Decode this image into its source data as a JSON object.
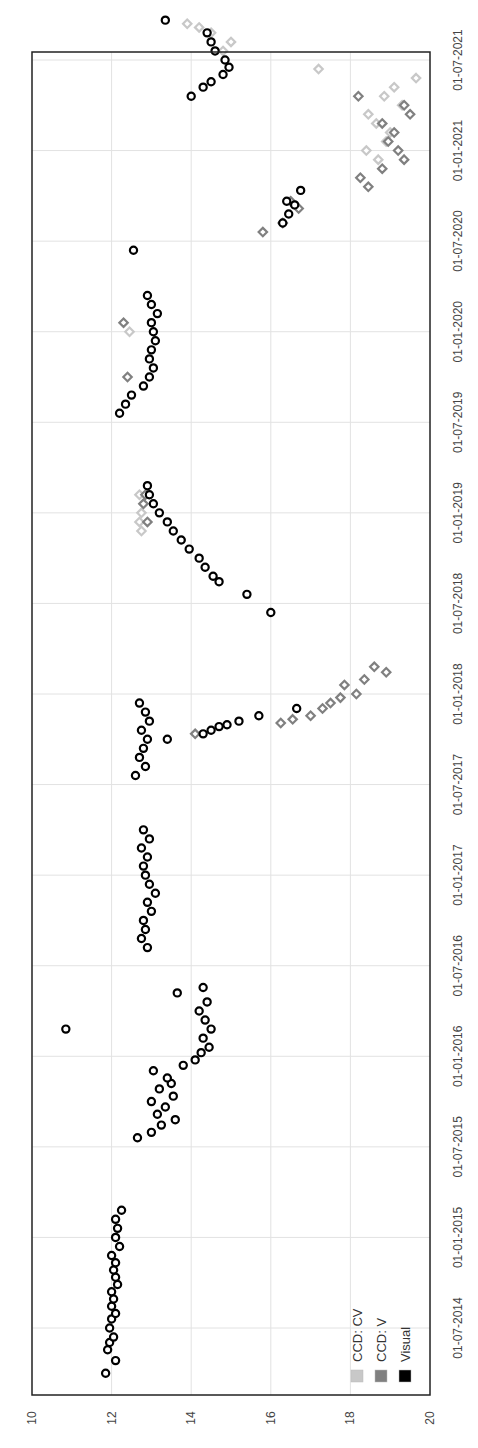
{
  "chart_data": {
    "type": "scatter",
    "title": "",
    "orientation": "rotated-90 (magnitude axis horizontal along bottom/left edge, date axis vertical on right edge)",
    "xlabel": "",
    "ylabel": "",
    "magnitude_axis": {
      "ticks": [
        "10",
        "12",
        "14",
        "16",
        "18",
        "20"
      ],
      "range": [
        10,
        20
      ],
      "inverted": false
    },
    "date_axis": {
      "ticks": [
        "01-07-2014",
        "01-01-2015",
        "01-07-2015",
        "01-01-2016",
        "01-07-2016",
        "01-01-2017",
        "01-07-2017",
        "01-01-2018",
        "01-07-2018",
        "01-01-2019",
        "01-07-2019",
        "01-01-2020",
        "01-07-2020",
        "01-01-2021",
        "01-07-2021"
      ]
    },
    "grid": true,
    "legend": {
      "position": "lower-right (rotated)",
      "entries": [
        {
          "label": "CCD: CV",
          "color": "#c8c8c8"
        },
        {
          "label": "CCD: V",
          "color": "#808080"
        },
        {
          "label": "Visual",
          "color": "#000000"
        }
      ]
    },
    "series": [
      {
        "name": "Visual",
        "marker": "circle",
        "color": "#000000",
        "points": [
          [
            2014.25,
            11.85
          ],
          [
            2014.32,
            12.1
          ],
          [
            2014.38,
            11.9
          ],
          [
            2014.42,
            11.95
          ],
          [
            2014.45,
            12.05
          ],
          [
            2014.5,
            11.95
          ],
          [
            2014.55,
            12.0
          ],
          [
            2014.58,
            12.1
          ],
          [
            2014.62,
            12.0
          ],
          [
            2014.66,
            12.05
          ],
          [
            2014.7,
            12.0
          ],
          [
            2014.74,
            12.15
          ],
          [
            2014.78,
            12.1
          ],
          [
            2014.82,
            12.05
          ],
          [
            2014.86,
            12.1
          ],
          [
            2014.9,
            12.0
          ],
          [
            2014.95,
            12.2
          ],
          [
            2015.0,
            12.1
          ],
          [
            2015.05,
            12.15
          ],
          [
            2015.1,
            12.1
          ],
          [
            2015.15,
            12.25
          ],
          [
            2015.55,
            12.65
          ],
          [
            2015.58,
            13.0
          ],
          [
            2015.62,
            13.25
          ],
          [
            2015.65,
            13.6
          ],
          [
            2015.68,
            13.15
          ],
          [
            2015.72,
            13.35
          ],
          [
            2015.75,
            13.0
          ],
          [
            2015.78,
            13.55
          ],
          [
            2015.82,
            13.2
          ],
          [
            2015.85,
            13.5
          ],
          [
            2015.88,
            13.4
          ],
          [
            2015.92,
            13.05
          ],
          [
            2015.95,
            13.8
          ],
          [
            2015.98,
            14.1
          ],
          [
            2016.02,
            14.25
          ],
          [
            2016.05,
            14.45
          ],
          [
            2016.1,
            14.3
          ],
          [
            2016.15,
            14.5
          ],
          [
            2016.2,
            14.35
          ],
          [
            2016.25,
            14.2
          ],
          [
            2016.3,
            14.4
          ],
          [
            2016.35,
            13.65
          ],
          [
            2016.38,
            14.3
          ],
          [
            2016.15,
            10.85
          ],
          [
            2016.6,
            12.9
          ],
          [
            2016.65,
            12.75
          ],
          [
            2016.7,
            12.85
          ],
          [
            2016.75,
            12.8
          ],
          [
            2016.8,
            13.0
          ],
          [
            2016.85,
            12.9
          ],
          [
            2016.9,
            13.1
          ],
          [
            2016.95,
            12.95
          ],
          [
            2017.0,
            12.85
          ],
          [
            2017.05,
            12.8
          ],
          [
            2017.1,
            12.9
          ],
          [
            2017.15,
            12.75
          ],
          [
            2017.2,
            12.95
          ],
          [
            2017.25,
            12.8
          ],
          [
            2017.55,
            12.6
          ],
          [
            2017.6,
            12.85
          ],
          [
            2017.65,
            12.7
          ],
          [
            2017.7,
            12.8
          ],
          [
            2017.75,
            12.9
          ],
          [
            2017.8,
            12.75
          ],
          [
            2017.85,
            12.95
          ],
          [
            2017.9,
            12.85
          ],
          [
            2017.95,
            12.7
          ],
          [
            2017.75,
            13.4
          ],
          [
            2017.78,
            14.3
          ],
          [
            2017.8,
            14.5
          ],
          [
            2017.82,
            14.7
          ],
          [
            2017.83,
            14.9
          ],
          [
            2017.85,
            15.2
          ],
          [
            2017.88,
            15.7
          ],
          [
            2017.92,
            16.65
          ],
          [
            2018.45,
            16.0
          ],
          [
            2018.55,
            15.4
          ],
          [
            2018.62,
            14.7
          ],
          [
            2018.65,
            14.55
          ],
          [
            2018.7,
            14.35
          ],
          [
            2018.75,
            14.2
          ],
          [
            2018.8,
            13.95
          ],
          [
            2018.85,
            13.75
          ],
          [
            2018.9,
            13.55
          ],
          [
            2018.95,
            13.4
          ],
          [
            2019.0,
            13.2
          ],
          [
            2019.05,
            13.05
          ],
          [
            2019.1,
            12.95
          ],
          [
            2019.15,
            12.9
          ],
          [
            2019.55,
            12.2
          ],
          [
            2019.6,
            12.35
          ],
          [
            2019.65,
            12.5
          ],
          [
            2019.7,
            12.8
          ],
          [
            2019.75,
            12.95
          ],
          [
            2019.8,
            13.05
          ],
          [
            2019.85,
            12.95
          ],
          [
            2019.9,
            13.0
          ],
          [
            2019.95,
            13.1
          ],
          [
            2020.0,
            13.05
          ],
          [
            2020.05,
            13.0
          ],
          [
            2020.1,
            13.15
          ],
          [
            2020.15,
            13.0
          ],
          [
            2020.2,
            12.9
          ],
          [
            2020.45,
            12.55
          ],
          [
            2020.6,
            16.3
          ],
          [
            2020.65,
            16.45
          ],
          [
            2020.7,
            16.6
          ],
          [
            2020.72,
            16.4
          ],
          [
            2020.78,
            16.75
          ],
          [
            2021.3,
            14.0
          ],
          [
            2021.35,
            14.3
          ],
          [
            2021.38,
            14.5
          ],
          [
            2021.42,
            14.8
          ],
          [
            2021.46,
            14.95
          ],
          [
            2021.5,
            14.85
          ],
          [
            2021.55,
            14.6
          ],
          [
            2021.6,
            14.5
          ],
          [
            2021.65,
            14.4
          ],
          [
            2021.72,
            13.35
          ]
        ]
      },
      {
        "name": "CCD: V",
        "marker": "diamond",
        "color": "#808080",
        "points": [
          [
            2017.78,
            14.1
          ],
          [
            2017.84,
            16.25
          ],
          [
            2017.86,
            16.55
          ],
          [
            2017.88,
            17.0
          ],
          [
            2017.92,
            17.3
          ],
          [
            2017.95,
            17.5
          ],
          [
            2017.98,
            17.75
          ],
          [
            2018.0,
            18.15
          ],
          [
            2018.05,
            17.85
          ],
          [
            2018.08,
            18.35
          ],
          [
            2018.12,
            18.9
          ],
          [
            2018.15,
            18.6
          ],
          [
            2018.95,
            12.9
          ],
          [
            2019.05,
            12.8
          ],
          [
            2019.1,
            12.85
          ],
          [
            2019.75,
            12.4
          ],
          [
            2020.05,
            12.3
          ],
          [
            2020.55,
            15.8
          ],
          [
            2020.6,
            16.3
          ],
          [
            2020.68,
            16.7
          ],
          [
            2020.72,
            16.5
          ],
          [
            2020.8,
            18.45
          ],
          [
            2020.85,
            18.25
          ],
          [
            2020.9,
            18.8
          ],
          [
            2020.95,
            19.35
          ],
          [
            2021.0,
            19.2
          ],
          [
            2021.05,
            18.95
          ],
          [
            2021.1,
            19.1
          ],
          [
            2021.15,
            18.8
          ],
          [
            2021.2,
            19.5
          ],
          [
            2021.25,
            19.35
          ],
          [
            2021.3,
            18.2
          ]
        ]
      },
      {
        "name": "CCD: CV",
        "marker": "diamond",
        "color": "#c8c8c8",
        "points": [
          [
            2018.9,
            12.75
          ],
          [
            2018.95,
            12.7
          ],
          [
            2019.0,
            12.75
          ],
          [
            2019.05,
            12.8
          ],
          [
            2019.1,
            12.7
          ],
          [
            2020.0,
            12.45
          ],
          [
            2020.95,
            18.7
          ],
          [
            2021.0,
            18.4
          ],
          [
            2021.05,
            18.9
          ],
          [
            2021.1,
            19.0
          ],
          [
            2021.15,
            18.65
          ],
          [
            2021.2,
            18.45
          ],
          [
            2021.25,
            19.3
          ],
          [
            2021.3,
            18.85
          ],
          [
            2021.35,
            19.1
          ],
          [
            2021.4,
            19.65
          ],
          [
            2021.45,
            17.2
          ],
          [
            2021.55,
            14.8
          ],
          [
            2021.6,
            15.0
          ],
          [
            2021.65,
            14.5
          ],
          [
            2021.68,
            14.2
          ],
          [
            2021.7,
            13.9
          ]
        ]
      }
    ]
  },
  "labels": {
    "mag_ticks": [
      "10",
      "12",
      "14",
      "16",
      "18",
      "20"
    ],
    "date_ticks": [
      "01-07-2014",
      "01-01-2015",
      "01-07-2015",
      "01-01-2016",
      "01-07-2016",
      "01-01-2017",
      "01-07-2017",
      "01-01-2018",
      "01-07-2018",
      "01-01-2019",
      "01-07-2019",
      "01-01-2020",
      "01-07-2020",
      "01-01-2021",
      "01-07-2021"
    ],
    "legend": [
      "CCD: CV",
      "CCD: V",
      "Visual"
    ]
  },
  "colors": {
    "frame": "#222222",
    "grid": "#e2e2e2",
    "visual": "#000000",
    "ccd_v": "#808080",
    "ccd_cv": "#c8c8c8"
  }
}
